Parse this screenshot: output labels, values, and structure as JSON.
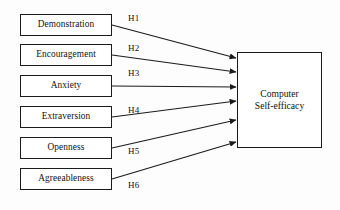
{
  "diagram": {
    "type": "path-model",
    "background_color": "#fdfdfd",
    "stroke_color": "#1b1b1b",
    "text_color": "#111111",
    "predictors": [
      {
        "id": "demonstration",
        "label": "Demonstration",
        "x": 20,
        "y": 14,
        "w": 92,
        "h": 22
      },
      {
        "id": "encouragement",
        "label": "Encouragement",
        "x": 20,
        "y": 44,
        "w": 92,
        "h": 22
      },
      {
        "id": "anxiety",
        "label": "Anxiety",
        "x": 20,
        "y": 75,
        "w": 92,
        "h": 22
      },
      {
        "id": "extraversion",
        "label": "Extraversion",
        "x": 20,
        "y": 106,
        "w": 92,
        "h": 22
      },
      {
        "id": "openness",
        "label": "Openness",
        "x": 20,
        "y": 137,
        "w": 92,
        "h": 22
      },
      {
        "id": "agreeableness",
        "label": "Agreeableness",
        "x": 20,
        "y": 168,
        "w": 92,
        "h": 22
      }
    ],
    "outcome": {
      "id": "computer-self-efficacy",
      "label_line1": "Computer",
      "label_line2": "Self-efficacy",
      "x": 237,
      "y": 52,
      "w": 85,
      "h": 96
    },
    "paths": [
      {
        "id": "h1",
        "label": "H1",
        "from": "demonstration",
        "from_x": 112,
        "from_y": 25,
        "to_x": 236,
        "to_y": 58,
        "label_x": 128,
        "label_y": 13
      },
      {
        "id": "h2",
        "label": "H2",
        "from": "encouragement",
        "from_x": 112,
        "from_y": 55,
        "to_x": 236,
        "to_y": 72,
        "label_x": 128,
        "label_y": 43
      },
      {
        "id": "h3",
        "label": "H3",
        "from": "anxiety",
        "from_x": 112,
        "from_y": 86,
        "to_x": 236,
        "to_y": 87,
        "label_x": 128,
        "label_y": 68
      },
      {
        "id": "h4",
        "label": "H4",
        "from": "extraversion",
        "from_x": 112,
        "from_y": 117,
        "to_x": 236,
        "to_y": 101,
        "label_x": 128,
        "label_y": 105
      },
      {
        "id": "h5",
        "label": "H5",
        "from": "openness",
        "from_x": 112,
        "from_y": 148,
        "to_x": 236,
        "to_y": 120,
        "label_x": 128,
        "label_y": 146
      },
      {
        "id": "h6",
        "label": "H6",
        "from": "agreeableness",
        "from_x": 112,
        "from_y": 179,
        "to_x": 236,
        "to_y": 142,
        "label_x": 128,
        "label_y": 180
      }
    ]
  }
}
